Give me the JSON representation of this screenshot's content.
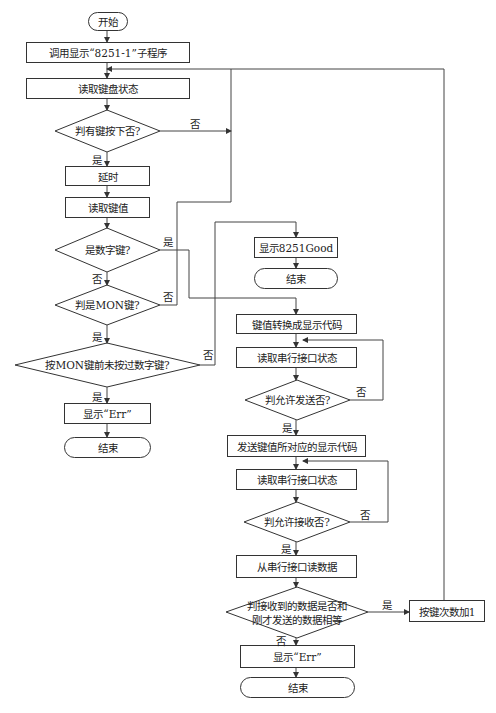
{
  "diagram": {
    "type": "flowchart",
    "nodes": {
      "start": "开始",
      "call_display": "调用显示“8251-1”子程序",
      "read_keyboard": "读取键盘状态",
      "key_pressed": "判有键按下否?",
      "delay": "延时",
      "read_key": "读取键值",
      "is_digit": "是数字键?",
      "is_mon": "判是MON键?",
      "mon_no_digit": "按MON键前未按过数字键?",
      "show_err_1": "显示“Err”",
      "end_1": "结束",
      "show_good": "显示8251Good",
      "end_2": "结束",
      "convert_code": "键值转换成显示代码",
      "read_serial_1": "读取串行接口状态",
      "allow_send": "判允许发送否?",
      "send_code": "发送键值所对应的显示代码",
      "read_serial_2": "读取串行接口状态",
      "allow_recv": "判允许接收否?",
      "read_data": "从串行接口读数据",
      "compare_line1": "判接收到的数据是否和",
      "compare_line2": "刚才发送的数据相等",
      "inc_count": "按键次数加1",
      "show_err_2": "显示“Err”",
      "end_3": "结束"
    },
    "labels": {
      "yes": "是",
      "no": "否"
    },
    "edges": [
      {
        "from": "start",
        "to": "call_display"
      },
      {
        "from": "call_display",
        "to": "read_keyboard"
      },
      {
        "from": "read_keyboard",
        "to": "key_pressed"
      },
      {
        "from": "key_pressed",
        "to": "delay",
        "label": "是"
      },
      {
        "from": "key_pressed",
        "to": "read_keyboard",
        "label": "否"
      },
      {
        "from": "delay",
        "to": "read_key"
      },
      {
        "from": "read_key",
        "to": "is_digit"
      },
      {
        "from": "is_digit",
        "to": "convert_code",
        "label": "是"
      },
      {
        "from": "is_digit",
        "to": "is_mon",
        "label": "否"
      },
      {
        "from": "is_mon",
        "to": "mon_no_digit",
        "label": "是"
      },
      {
        "from": "is_mon",
        "to": "read_keyboard",
        "label": "否"
      },
      {
        "from": "mon_no_digit",
        "to": "show_err_1",
        "label": "是"
      },
      {
        "from": "mon_no_digit",
        "to": "show_good",
        "label": "否"
      },
      {
        "from": "show_err_1",
        "to": "end_1"
      },
      {
        "from": "show_good",
        "to": "end_2"
      },
      {
        "from": "convert_code",
        "to": "read_serial_1"
      },
      {
        "from": "read_serial_1",
        "to": "allow_send"
      },
      {
        "from": "allow_send",
        "to": "send_code",
        "label": "是"
      },
      {
        "from": "allow_send",
        "to": "read_serial_1",
        "label": "否"
      },
      {
        "from": "send_code",
        "to": "read_serial_2"
      },
      {
        "from": "read_serial_2",
        "to": "allow_recv"
      },
      {
        "from": "allow_recv",
        "to": "read_data",
        "label": "是"
      },
      {
        "from": "allow_recv",
        "to": "read_serial_2",
        "label": "否"
      },
      {
        "from": "read_data",
        "to": "compare"
      },
      {
        "from": "compare",
        "to": "inc_count",
        "label": "是"
      },
      {
        "from": "compare",
        "to": "show_err_2",
        "label": "否"
      },
      {
        "from": "inc_count",
        "to": "read_keyboard"
      },
      {
        "from": "show_err_2",
        "to": "end_3"
      }
    ]
  }
}
